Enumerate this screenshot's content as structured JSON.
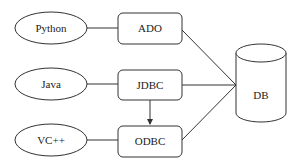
{
  "diagram": {
    "languages": [
      {
        "label": "Python"
      },
      {
        "label": "Java"
      },
      {
        "label": "VC++"
      }
    ],
    "interfaces": [
      {
        "label": "ADO"
      },
      {
        "label": "JDBC"
      },
      {
        "label": "ODBC"
      }
    ],
    "database": {
      "label": "DB"
    },
    "colors": {
      "stroke": "#333333",
      "background": "#ffffff",
      "text": "#222222"
    }
  }
}
